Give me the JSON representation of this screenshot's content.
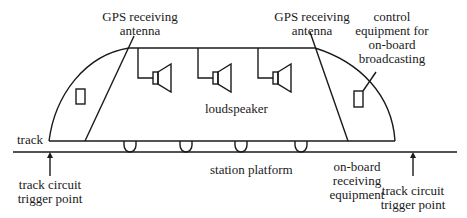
{
  "diagram": {
    "title": "",
    "labels": {
      "gps_left": [
        "GPS receiving",
        "antenna"
      ],
      "gps_right": [
        "GPS receiving",
        "antenna"
      ],
      "control": [
        "control",
        "equipment for",
        "on-board",
        "broadcasting"
      ],
      "loudspeaker": "loudspeaker",
      "track": "track",
      "station_platform": "station platform",
      "onboard_receiver": [
        "on-board",
        "receiving",
        "equipment"
      ],
      "trigger_left": [
        "track circuit",
        "trigger point"
      ],
      "trigger_right": [
        "track circuit",
        "trigger point"
      ]
    },
    "components": {
      "speakers_count": 3,
      "wheels_count": 4,
      "windows_count": 2
    },
    "colors": {
      "line": "#1a1a1a",
      "background": "#ffffff"
    }
  }
}
